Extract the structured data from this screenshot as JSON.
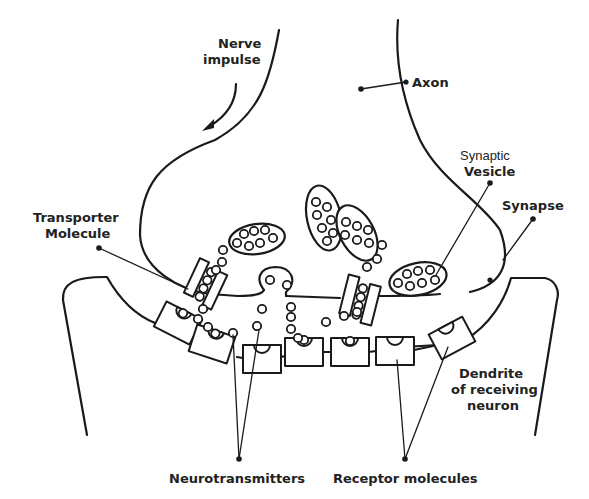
{
  "diagram": {
    "type": "neuron-synapse-illustration",
    "labels": {
      "nerve_impulse_line1": "Nerve",
      "nerve_impulse_line2": "impulse",
      "axon": "Axon",
      "synaptic_vesicle_line1": "Synaptic",
      "synaptic_vesicle_line2": "Vesicle",
      "synapse": "Synapse",
      "transporter_line1": "Transporter",
      "transporter_line2": "Molecule",
      "dendrite_line1": "Dendrite",
      "dendrite_line2": "of receiving",
      "dendrite_line3": "neuron",
      "neurotransmitters": "Neurotransmitters",
      "receptor_molecules": "Receptor molecules"
    },
    "colors": {
      "ink": "#1a1a1a",
      "background": "#ffffff"
    },
    "counts": {
      "vesicles": 4,
      "transporters": 2,
      "receptors": 8
    }
  }
}
